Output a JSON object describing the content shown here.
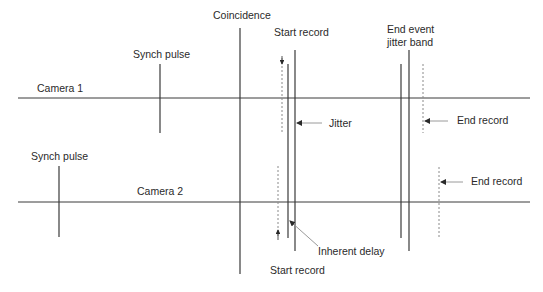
{
  "diagram": {
    "colors": {
      "line": "#3a3a3a",
      "dashed": "#8a8a8a",
      "leader": "#9a9a9a",
      "text": "#2a2a2a"
    },
    "labels": {
      "coincidence": "Coincidence",
      "synch_pulse_1": "Synch pulse",
      "synch_pulse_2": "Synch pulse",
      "camera_1": "Camera 1",
      "camera_2": "Camera 2",
      "start_record_top": "Start record",
      "start_record_bottom": "Start record",
      "end_event_line1": "End event",
      "end_event_line2": "jitter band",
      "jitter": "Jitter",
      "end_record_1": "End record",
      "end_record_2": "End record",
      "inherent_delay": "Inherent delay"
    }
  }
}
